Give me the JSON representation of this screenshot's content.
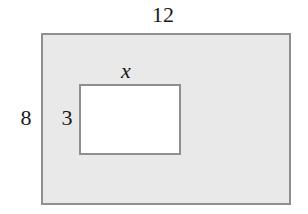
{
  "diagram": {
    "type": "rectangle-with-inner-rectangle",
    "outer_rectangle": {
      "width_label": "12",
      "height_label": "8",
      "fill": "#e9e9e9",
      "border": "#8f8f8f"
    },
    "inner_rectangle": {
      "width_label": "x",
      "height_label": "3",
      "fill": "#ffffff",
      "border": "#8f8f8f"
    }
  }
}
